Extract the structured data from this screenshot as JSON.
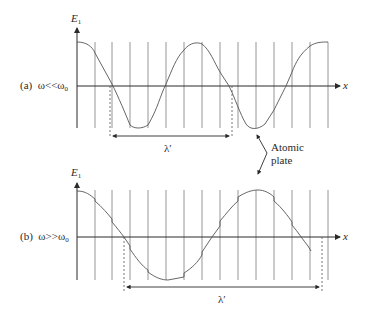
{
  "panels": [
    {
      "id": "a",
      "label": "(a)",
      "condition": "ω<<ω",
      "condition_sub": "0",
      "y_axis_label": "E",
      "y_axis_sub": "1",
      "x_axis_label": "x",
      "wavelength_label": "λ′",
      "description": "Slowly varying field, wavelength spans many atomic plates"
    },
    {
      "id": "b",
      "label": "(b)",
      "condition": "ω>>ω",
      "condition_sub": "0",
      "y_axis_label": "E",
      "y_axis_sub": "1",
      "x_axis_label": "x",
      "wavelength_label": "λ′",
      "description": "Rapidly varying field with small steps at each atomic plate"
    }
  ],
  "annotation": {
    "line1": "Atomic",
    "line2": "plate"
  },
  "colors": {
    "ink": "#2a2a2a",
    "plate": "#7a7a7a",
    "background": "#ffffff"
  }
}
